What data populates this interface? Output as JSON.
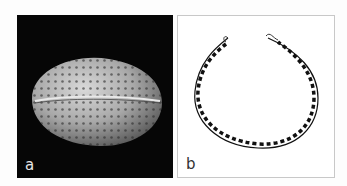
{
  "figure": {
    "panels": [
      {
        "id": "a",
        "label": "a",
        "description": "SEM image of reticulate pollen grain with longitudinal furrow",
        "background": "#060606"
      },
      {
        "id": "b",
        "label": "b",
        "description": "Line drawing cross-section of pollen wall (exine)",
        "background": "#ffffff"
      }
    ]
  }
}
